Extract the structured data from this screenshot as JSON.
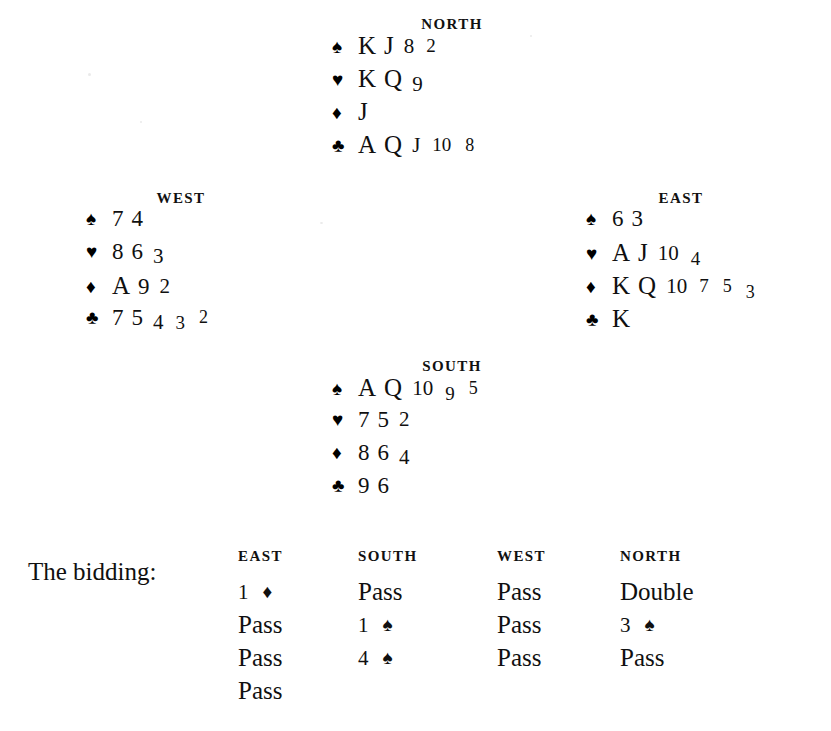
{
  "suits": {
    "spade": "♠",
    "heart": "♥",
    "diamond": "♦",
    "club": "♣"
  },
  "hands": {
    "north": {
      "label": "NORTH",
      "suits": [
        {
          "symbol": "♠",
          "name": "spades",
          "cards": [
            "K",
            "J",
            "8",
            "2"
          ]
        },
        {
          "symbol": "♥",
          "name": "hearts",
          "cards": [
            "K",
            "Q",
            "9"
          ]
        },
        {
          "symbol": "♦",
          "name": "diamonds",
          "cards": [
            "J"
          ]
        },
        {
          "symbol": "♣",
          "name": "clubs",
          "cards": [
            "A",
            "Q",
            "J",
            "10",
            "8"
          ]
        }
      ]
    },
    "west": {
      "label": "WEST",
      "suits": [
        {
          "symbol": "♠",
          "name": "spades",
          "cards": [
            "7",
            "4"
          ]
        },
        {
          "symbol": "♥",
          "name": "hearts",
          "cards": [
            "8",
            "6",
            "3"
          ]
        },
        {
          "symbol": "♦",
          "name": "diamonds",
          "cards": [
            "A",
            "9",
            "2"
          ]
        },
        {
          "symbol": "♣",
          "name": "clubs",
          "cards": [
            "7",
            "5",
            "4",
            "3",
            "2"
          ]
        }
      ]
    },
    "east": {
      "label": "EAST",
      "suits": [
        {
          "symbol": "♠",
          "name": "spades",
          "cards": [
            "6",
            "3"
          ]
        },
        {
          "symbol": "♥",
          "name": "hearts",
          "cards": [
            "A",
            "J",
            "10",
            "4"
          ]
        },
        {
          "symbol": "♦",
          "name": "diamonds",
          "cards": [
            "K",
            "Q",
            "10",
            "7",
            "5",
            "3"
          ]
        },
        {
          "symbol": "♣",
          "name": "clubs",
          "cards": [
            "K"
          ]
        }
      ]
    },
    "south": {
      "label": "SOUTH",
      "suits": [
        {
          "symbol": "♠",
          "name": "spades",
          "cards": [
            "A",
            "Q",
            "10",
            "9",
            "5"
          ]
        },
        {
          "symbol": "♥",
          "name": "hearts",
          "cards": [
            "7",
            "5",
            "2"
          ]
        },
        {
          "symbol": "♦",
          "name": "diamonds",
          "cards": [
            "8",
            "6",
            "4"
          ]
        },
        {
          "symbol": "♣",
          "name": "clubs",
          "cards": [
            "9",
            "6"
          ]
        }
      ]
    }
  },
  "bidding": {
    "title": "The bidding:",
    "columns": [
      {
        "header": "EAST",
        "bids": [
          {
            "level": "1",
            "suit": "♦"
          },
          {
            "text": "Pass"
          },
          {
            "text": "Pass"
          },
          {
            "text": "Pass"
          }
        ]
      },
      {
        "header": "SOUTH",
        "bids": [
          {
            "text": "Pass"
          },
          {
            "level": "1",
            "suit": "♠"
          },
          {
            "level": "4",
            "suit": "♠"
          }
        ]
      },
      {
        "header": "WEST",
        "bids": [
          {
            "text": "Pass"
          },
          {
            "text": "Pass"
          },
          {
            "text": "Pass"
          }
        ]
      },
      {
        "header": "NORTH",
        "bids": [
          {
            "text": "Double"
          },
          {
            "level": "3",
            "suit": "♠"
          },
          {
            "text": "Pass"
          }
        ]
      }
    ]
  }
}
